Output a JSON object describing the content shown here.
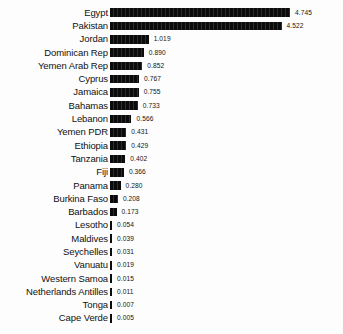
{
  "chart_data": {
    "type": "bar",
    "orientation": "horizontal",
    "title": "",
    "subtitle": "",
    "xlabel": "",
    "ylabel": "",
    "grid": false,
    "legend": null,
    "legend_position": "none",
    "value_labels_shown": true,
    "value_label_format": "0.000",
    "xlim": [
      0,
      4.745
    ],
    "sort": "descending",
    "bar_color": "#0b0b0b",
    "background_color": "#fdfdfd",
    "categories": [
      "Egypt",
      "Pakistan",
      "Jordan",
      "Dominican Rep",
      "Yemen Arab Rep",
      "Cyprus",
      "Jamaica",
      "Bahamas",
      "Lebanon",
      "Yemen PDR",
      "Ethiopia",
      "Tanzania",
      "Fiji",
      "Panama",
      "Burkina Faso",
      "Barbados",
      "Lesotho",
      "Maldives",
      "Seychelles",
      "Vanuatu",
      "Western Samoa",
      "Netherlands Antilles",
      "Tonga",
      "Cape Verde"
    ],
    "values": [
      4.745,
      4.522,
      1.019,
      0.89,
      0.852,
      0.767,
      0.755,
      0.733,
      0.566,
      0.431,
      0.429,
      0.402,
      0.366,
      0.28,
      0.208,
      0.173,
      0.054,
      0.039,
      0.031,
      0.019,
      0.015,
      0.011,
      0.007,
      0.005
    ],
    "value_labels": [
      "4.745",
      "4.522",
      "1.019",
      "0.890",
      "0.852",
      "0.767",
      "0.755",
      "0.733",
      "0.566",
      "0.431",
      "0.429",
      "0.402",
      "0.366",
      "0.280",
      "0.208",
      "0.173",
      "0.054",
      "0.039",
      "0.031",
      "0.019",
      "0.015",
      "0.011",
      "0.007",
      "0.005"
    ]
  }
}
